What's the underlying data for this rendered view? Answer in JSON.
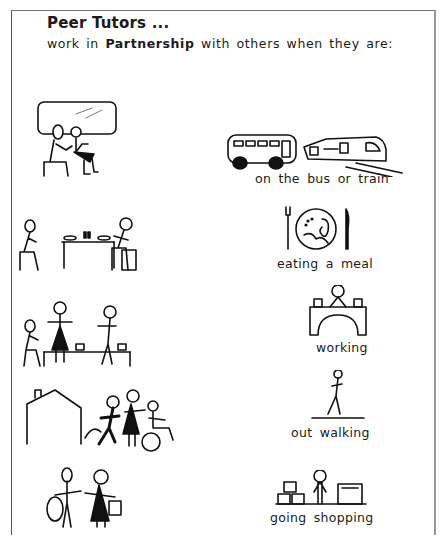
{
  "heading": {
    "title": "Peer Tutors ...",
    "subtitle_pre": "work in ",
    "subtitle_bold": "Partnership",
    "subtitle_post": " with others when they are:"
  },
  "activities": [
    {
      "label": "on the bus  or  train",
      "left_icon": "people-sitting-on-train-icon",
      "right_icon": "bus-and-train-icon"
    },
    {
      "label": "eating a meal",
      "left_icon": "people-eating-at-table-icon",
      "right_icon": "plate-fork-knife-icon"
    },
    {
      "label": "working",
      "left_icon": "people-working-at-table-icon",
      "right_icon": "person-at-desk-icon"
    },
    {
      "label": "out walking",
      "left_icon": "people-walking-near-house-icon",
      "right_icon": "person-walking-icon"
    },
    {
      "label": "going shopping",
      "left_icon": "people-with-shopping-bags-icon",
      "right_icon": "shop-counter-icon"
    }
  ]
}
